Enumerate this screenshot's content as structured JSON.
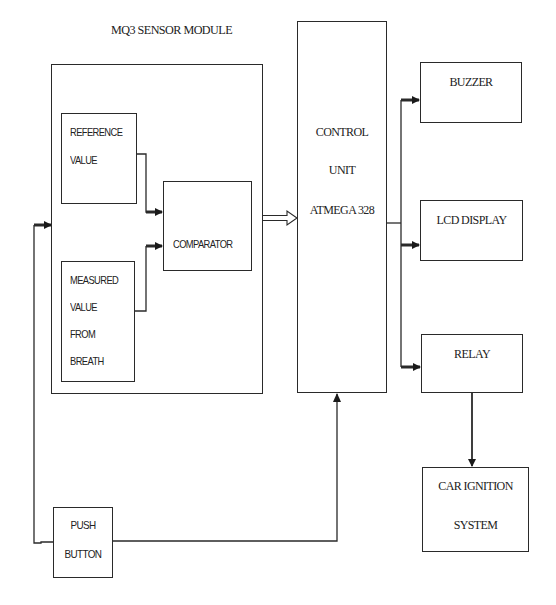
{
  "diagram": {
    "title": "MQ3 SENSOR MODULE",
    "blocks": {
      "reference": {
        "lines": [
          "REFERENCE",
          "VALUE"
        ]
      },
      "measured": {
        "lines": [
          "MEASURED",
          "VALUE",
          "FROM",
          "BREATH"
        ]
      },
      "comparator": {
        "label": "COMPARATOR"
      },
      "control_unit": {
        "lines": [
          "CONTROL",
          "UNIT",
          "ATMEGA 328"
        ]
      },
      "buzzer": {
        "label": "BUZZER"
      },
      "lcd": {
        "label": "LCD DISPLAY"
      },
      "relay": {
        "label": "RELAY"
      },
      "car_ignition": {
        "lines": [
          "CAR IGNITION",
          "SYSTEM"
        ]
      },
      "push_button": {
        "lines": [
          "PUSH",
          "BUTTON"
        ]
      }
    },
    "connections": [
      {
        "from": "REFERENCE VALUE",
        "to": "COMPARATOR",
        "style": "solid-arrow"
      },
      {
        "from": "MEASURED VALUE FROM BREATH",
        "to": "COMPARATOR",
        "style": "solid-arrow"
      },
      {
        "from": "MQ3 SENSOR MODULE",
        "to": "CONTROL UNIT ATMEGA 328",
        "style": "double-outline-arrow"
      },
      {
        "from": "CONTROL UNIT ATMEGA 328",
        "to": "BUZZER",
        "style": "solid-arrow"
      },
      {
        "from": "CONTROL UNIT ATMEGA 328",
        "to": "LCD DISPLAY",
        "style": "solid-arrow"
      },
      {
        "from": "CONTROL UNIT ATMEGA 328",
        "to": "RELAY",
        "style": "solid-arrow"
      },
      {
        "from": "RELAY",
        "to": "CAR IGNITION SYSTEM",
        "style": "solid-arrow"
      },
      {
        "from": "PUSH BUTTON",
        "to": "CONTROL UNIT ATMEGA 328",
        "style": "solid-arrow"
      },
      {
        "from": "PUSH BUTTON",
        "to": "MQ3 SENSOR MODULE",
        "style": "solid-arrow"
      }
    ],
    "colors": {
      "stroke": "#2a2a2a",
      "background": "#ffffff"
    }
  }
}
